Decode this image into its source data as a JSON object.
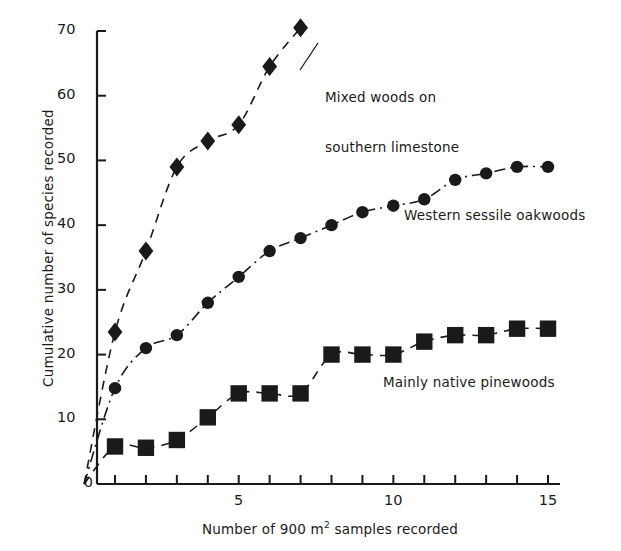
{
  "chart_data": {
    "type": "scatter",
    "title": "",
    "xlabel": "Number of 900 m² samples recorded",
    "ylabel": "Cumulative number of species recorded",
    "xlim": [
      0,
      15.4
    ],
    "ylim": [
      0,
      72
    ],
    "xticks": [
      1,
      2,
      3,
      4,
      5,
      6,
      7,
      8,
      9,
      10,
      11,
      12,
      13,
      14,
      15
    ],
    "xticklabels_shown": {
      "5": "5",
      "10": "10",
      "15": "15"
    },
    "yticks": [
      0,
      10,
      20,
      30,
      40,
      50,
      60,
      70
    ],
    "yticklabels": [
      "0",
      "10",
      "20",
      "30",
      "40",
      "50",
      "60",
      "70"
    ],
    "grid": false,
    "legend_position": "inline-annotations",
    "series": [
      {
        "name": "Mixed woods on southern limestone",
        "marker": "diamond",
        "line": "dashed",
        "x": [
          1,
          2,
          3,
          4,
          5,
          6,
          7
        ],
        "values": [
          23.5,
          36,
          49,
          53,
          55.5,
          64.5,
          70.5
        ]
      },
      {
        "name": "Western sessile oakwoods",
        "marker": "circle",
        "line": "dash-dot",
        "x": [
          1,
          2,
          3,
          4,
          5,
          6,
          7,
          8,
          9,
          10,
          11,
          12,
          13,
          14,
          15
        ],
        "values": [
          14.8,
          21,
          23,
          28,
          32,
          36,
          38,
          40,
          42,
          43,
          44,
          47,
          48,
          49,
          49
        ]
      },
      {
        "name": "Mainly native pinewoods",
        "marker": "square",
        "line": "dashed",
        "x": [
          1,
          2,
          3,
          4,
          5,
          6,
          7,
          8,
          9,
          10,
          11,
          12,
          13,
          14,
          15
        ],
        "values": [
          5.8,
          5.6,
          6.8,
          10.3,
          14,
          14,
          14,
          20,
          20,
          20,
          22,
          23,
          23,
          24,
          24
        ]
      }
    ],
    "annotations": [
      {
        "name": "mixed-woods-label",
        "line1": "Mixed woods on",
        "line2": "southern limestone"
      },
      {
        "name": "oakwoods-label",
        "line1": "Western sessile oakwoods",
        "line2": ""
      },
      {
        "name": "pinewoods-label",
        "line1": "Mainly native pinewoods",
        "line2": ""
      }
    ],
    "colors": {
      "ink": "#1a1a1a",
      "background": "#ffffff"
    }
  },
  "axis": {
    "xlabel_pre": "Number of 900 m",
    "xlabel_sup": "2",
    "xlabel_post": " samples recorded",
    "ylabel": "Cumulative number of species recorded"
  }
}
